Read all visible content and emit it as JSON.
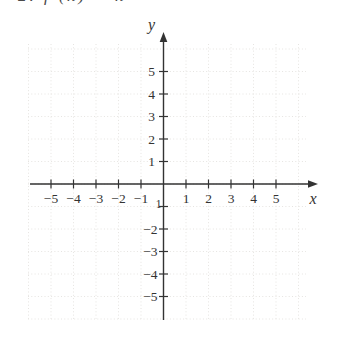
{
  "top_cropped_text": "2. f (x) = x",
  "chart_data": {
    "type": "scatter",
    "title": "",
    "xlabel": "x",
    "ylabel": "y",
    "xlim": [
      -6.2,
      6.8
    ],
    "ylim": [
      -6.3,
      6.7
    ],
    "grid": true,
    "grid_style": "dotted",
    "grid_range": [
      -6,
      6
    ],
    "series": [],
    "x_ticks": {
      "values": [
        -5,
        -4,
        -3,
        -2,
        -1,
        1,
        2,
        3,
        4,
        5
      ],
      "labels": [
        "−5",
        "−4",
        "−3",
        "−2",
        "−1",
        "1",
        "2",
        "3",
        "4",
        "5"
      ]
    },
    "y_ticks": {
      "values": [
        5,
        4,
        3,
        2,
        1,
        -1,
        -2,
        -3,
        -4,
        -5
      ],
      "labels": [
        "5",
        "4",
        "3",
        "2",
        "1",
        "1",
        "−2",
        "−3",
        "−4",
        "−5"
      ]
    },
    "colors": {
      "axis": "#333333",
      "grid": "#e6e4e1",
      "text": "#3a3a3a",
      "background": "#ffffff"
    }
  }
}
